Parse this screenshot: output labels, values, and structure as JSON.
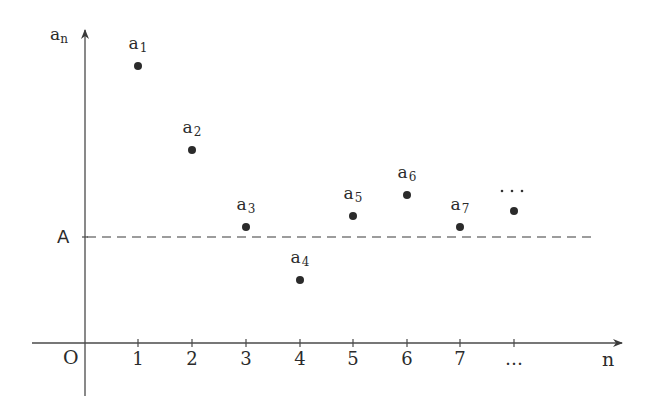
{
  "axes": {
    "y_label": "a",
    "y_label_sub": "n",
    "x_label": "n",
    "origin_label": "O",
    "reference_label": "A"
  },
  "ticks": [
    {
      "label": "1",
      "x": 138
    },
    {
      "label": "2",
      "x": 192
    },
    {
      "label": "3",
      "x": 246
    },
    {
      "label": "4",
      "x": 300
    },
    {
      "label": "5",
      "x": 353
    },
    {
      "label": "6",
      "x": 407
    },
    {
      "label": "7",
      "x": 460
    },
    {
      "label": "…",
      "x": 514
    }
  ],
  "points": [
    {
      "name": "a",
      "sub": "1",
      "x": 138,
      "y": 66
    },
    {
      "name": "a",
      "sub": "2",
      "x": 192,
      "y": 150
    },
    {
      "name": "a",
      "sub": "3",
      "x": 246,
      "y": 227
    },
    {
      "name": "a",
      "sub": "4",
      "x": 300,
      "y": 280
    },
    {
      "name": "a",
      "sub": "5",
      "x": 353,
      "y": 216
    },
    {
      "name": "a",
      "sub": "6",
      "x": 407,
      "y": 195
    },
    {
      "name": "a",
      "sub": "7",
      "x": 460,
      "y": 227
    },
    {
      "name": "…",
      "sub": "",
      "x": 514,
      "y": 211
    }
  ],
  "chart_data": {
    "type": "scatter",
    "title": "",
    "xlabel": "n",
    "ylabel": "a_n",
    "categories": [
      "1",
      "2",
      "3",
      "4",
      "5",
      "6",
      "7",
      "…"
    ],
    "series": [
      {
        "name": "a_n",
        "values": [
          2.61,
          1.82,
          1.09,
          0.59,
          1.2,
          1.4,
          1.09,
          1.25
        ]
      }
    ],
    "reference_line": {
      "label": "A",
      "value": 1.0,
      "style": "dashed"
    },
    "ylim": [
      -0.5,
      2.95
    ],
    "grid": false,
    "legend": "none"
  },
  "colors": {
    "ink": "#2b2b2b",
    "axis": "#4a4a4a",
    "background": "#ffffff"
  }
}
